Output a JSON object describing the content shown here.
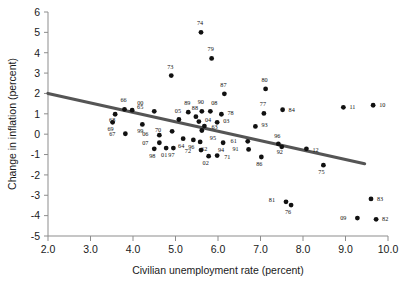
{
  "chart_data": {
    "type": "scatter",
    "title": "",
    "xlabel": "Civilian unemployment rate (percent)",
    "ylabel": "Change in inflation (percent)",
    "xlim": [
      2.0,
      10.0
    ],
    "ylim": [
      -5,
      6
    ],
    "xticks": [
      "2.0",
      "3.0",
      "4.0",
      "5.0",
      "6.0",
      "7.0",
      "8.0",
      "9.0",
      "10.0"
    ],
    "xtick_values": [
      2.0,
      3.0,
      4.0,
      5.0,
      6.0,
      7.0,
      8.0,
      9.0,
      10.0
    ],
    "yticks": [
      "6",
      "5",
      "4",
      "3",
      "2",
      "1",
      "0",
      "-1",
      "-2",
      "-3",
      "-4",
      "-5"
    ],
    "ytick_values": [
      6,
      5,
      4,
      3,
      2,
      1,
      0,
      -1,
      -2,
      -3,
      -4,
      -5
    ],
    "grid": false,
    "legend": "none",
    "marker_color": "#111111",
    "trendline_color": "#555555",
    "trendline": {
      "x0": 2.0,
      "y0": 2.0,
      "x1": 9.45,
      "y1": -1.45,
      "label": "regression-line"
    },
    "points": [
      {
        "label": "74",
        "x": 5.6,
        "y": 5.0,
        "lx": -1,
        "ly": -7
      },
      {
        "label": "79",
        "x": 5.85,
        "y": 3.72,
        "lx": -1,
        "ly": -7
      },
      {
        "label": "73",
        "x": 4.9,
        "y": 2.88,
        "lx": -1,
        "ly": -7
      },
      {
        "label": "87",
        "x": 6.15,
        "y": 1.98,
        "lx": -1,
        "ly": -7
      },
      {
        "label": "80",
        "x": 7.12,
        "y": 2.22,
        "lx": -1,
        "ly": -7
      },
      {
        "label": "10",
        "x": 9.65,
        "y": 1.42,
        "lx": 6,
        "ly": 2
      },
      {
        "label": "11",
        "x": 8.95,
        "y": 1.32,
        "lx": 6,
        "ly": 2
      },
      {
        "label": "84",
        "x": 7.52,
        "y": 1.2,
        "lx": 6,
        "ly": 2
      },
      {
        "label": "77",
        "x": 7.08,
        "y": 1.02,
        "lx": -1,
        "ly": -7
      },
      {
        "label": "65",
        "x": 4.5,
        "y": 1.12,
        "lx": -11,
        "ly": -2
      },
      {
        "label": "66",
        "x": 3.8,
        "y": 1.22,
        "lx": -1,
        "ly": -7
      },
      {
        "label": "00",
        "x": 3.98,
        "y": 1.18,
        "lx": 5,
        "ly": -5
      },
      {
        "label": "68",
        "x": 3.58,
        "y": 0.98,
        "lx": -3,
        "ly": 8
      },
      {
        "label": "89",
        "x": 5.3,
        "y": 1.08,
        "lx": -1,
        "ly": -7
      },
      {
        "label": "90",
        "x": 5.62,
        "y": 1.12,
        "lx": -1,
        "ly": -7
      },
      {
        "label": "08",
        "x": 5.82,
        "y": 1.12,
        "lx": 4,
        "ly": -6
      },
      {
        "label": "78",
        "x": 6.08,
        "y": 0.98,
        "lx": 6,
        "ly": 1
      },
      {
        "label": "88",
        "x": 5.48,
        "y": 0.86,
        "lx": -1,
        "ly": -7
      },
      {
        "label": "05",
        "x": 5.08,
        "y": 0.72,
        "lx": -1,
        "ly": -7
      },
      {
        "label": "04",
        "x": 5.55,
        "y": 0.62,
        "lx": 6,
        "ly": 0
      },
      {
        "label": "03",
        "x": 5.98,
        "y": 0.58,
        "lx": 6,
        "ly": 1
      },
      {
        "label": "69",
        "x": 3.52,
        "y": 0.58,
        "lx": -2,
        "ly": 9
      },
      {
        "label": "99",
        "x": 4.22,
        "y": 0.48,
        "lx": -2,
        "ly": 9
      },
      {
        "label": "63",
        "x": 5.68,
        "y": 0.4,
        "lx": 7,
        "ly": 3
      },
      {
        "label": "95",
        "x": 5.62,
        "y": 0.18,
        "lx": 8,
        "ly": 9
      },
      {
        "label": "93",
        "x": 6.88,
        "y": 0.38,
        "lx": 6,
        "ly": 1
      },
      {
        "label": "70",
        "x": 4.92,
        "y": 0.14,
        "lx": -11,
        "ly": 1
      },
      {
        "label": "67",
        "x": 3.82,
        "y": 0.02,
        "lx": -10,
        "ly": 2
      },
      {
        "label": "06",
        "x": 4.62,
        "y": -0.05,
        "lx": -11,
        "ly": 1
      },
      {
        "label": "64",
        "x": 5.18,
        "y": -0.22,
        "lx": -2,
        "ly": 9
      },
      {
        "label": "96",
        "x": 5.42,
        "y": -0.28,
        "lx": -2,
        "ly": 9
      },
      {
        "label": "62",
        "x": 5.58,
        "y": -0.38,
        "lx": 4,
        "ly": 9
      },
      {
        "label": "94",
        "x": 6.12,
        "y": -0.42,
        "lx": -2,
        "ly": 9
      },
      {
        "label": "61",
        "x": 6.7,
        "y": -0.35,
        "lx": -11,
        "ly": 2
      },
      {
        "label": "07",
        "x": 4.62,
        "y": -0.42,
        "lx": -11,
        "ly": 2
      },
      {
        "label": "98",
        "x": 4.5,
        "y": -0.72,
        "lx": -2,
        "ly": 9
      },
      {
        "label": "01",
        "x": 4.78,
        "y": -0.68,
        "lx": -2,
        "ly": 9
      },
      {
        "label": "97",
        "x": 4.95,
        "y": -0.68,
        "lx": -2,
        "ly": 9
      },
      {
        "label": "72",
        "x": 5.6,
        "y": -0.78,
        "lx": -10,
        "ly": 3
      },
      {
        "label": "02",
        "x": 5.78,
        "y": -1.08,
        "lx": -3,
        "ly": 9
      },
      {
        "label": "71",
        "x": 5.98,
        "y": -1.05,
        "lx": 7,
        "ly": 3
      },
      {
        "label": "91",
        "x": 6.72,
        "y": -0.75,
        "lx": -10,
        "ly": 2
      },
      {
        "label": "86",
        "x": 7.02,
        "y": -1.12,
        "lx": -2,
        "ly": 9
      },
      {
        "label": "96b",
        "x": 7.42,
        "y": -0.48,
        "lx": -1,
        "ly": -6
      },
      {
        "label": "92",
        "x": 7.5,
        "y": -0.62,
        "lx": -2,
        "ly": 7
      },
      {
        "label": "12",
        "x": 8.08,
        "y": -0.72,
        "lx": 6,
        "ly": 3
      },
      {
        "label": "75",
        "x": 8.48,
        "y": -1.52,
        "lx": -2,
        "ly": 9
      },
      {
        "label": "81",
        "x": 7.6,
        "y": -3.32,
        "lx": -11,
        "ly": 0
      },
      {
        "label": "76",
        "x": 7.72,
        "y": -3.48,
        "lx": -3,
        "ly": 9
      },
      {
        "label": "83",
        "x": 9.6,
        "y": -3.18,
        "lx": 6,
        "ly": 2
      },
      {
        "label": "09",
        "x": 9.28,
        "y": -4.12,
        "lx": -11,
        "ly": 2
      },
      {
        "label": "82",
        "x": 9.72,
        "y": -4.18,
        "lx": 6,
        "ly": 2
      }
    ]
  }
}
